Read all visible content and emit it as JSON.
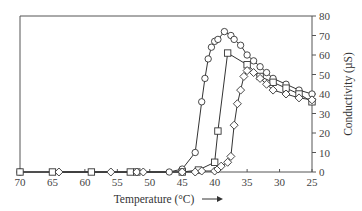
{
  "chart_data": {
    "type": "line",
    "title": "",
    "xlabel": "Temperature (°C) →",
    "ylabel": "Conductivity (µS)",
    "xlim": [
      70,
      25
    ],
    "ylim": [
      0,
      80
    ],
    "x_reversed": true,
    "x_ticks": [
      70,
      65,
      60,
      55,
      50,
      45,
      40,
      35,
      30,
      25
    ],
    "y_ticks": [
      0,
      10,
      20,
      30,
      40,
      50,
      60,
      70,
      80
    ],
    "y_axis_position": "right",
    "grid": false,
    "legend": null,
    "series": [
      {
        "name": "circles",
        "marker": "circle",
        "points": [
          [
            70,
            0
          ],
          [
            47,
            0
          ],
          [
            45,
            1.5
          ],
          [
            43,
            10
          ],
          [
            42,
            36
          ],
          [
            41.5,
            48
          ],
          [
            41,
            58
          ],
          [
            40.5,
            64
          ],
          [
            40,
            67
          ],
          [
            39.5,
            68
          ],
          [
            38.5,
            72
          ],
          [
            37.5,
            70
          ],
          [
            37,
            68
          ],
          [
            36,
            65
          ],
          [
            35,
            60
          ],
          [
            34,
            57
          ],
          [
            33,
            54
          ],
          [
            32,
            51
          ],
          [
            31,
            48
          ],
          [
            29,
            45
          ],
          [
            27,
            42
          ],
          [
            25,
            40
          ]
        ]
      },
      {
        "name": "squares",
        "marker": "square",
        "points": [
          [
            70,
            0
          ],
          [
            65,
            0
          ],
          [
            59,
            0
          ],
          [
            53,
            0
          ],
          [
            52,
            0
          ],
          [
            45,
            0
          ],
          [
            42.5,
            1
          ],
          [
            40,
            5
          ],
          [
            39.5,
            21
          ],
          [
            38,
            61
          ],
          [
            35,
            55
          ],
          [
            33,
            49
          ],
          [
            31,
            46
          ],
          [
            29,
            43
          ],
          [
            27,
            40
          ],
          [
            25,
            36
          ]
        ]
      },
      {
        "name": "diamonds",
        "marker": "diamond",
        "points": [
          [
            64,
            0
          ],
          [
            56,
            0
          ],
          [
            52,
            0
          ],
          [
            51,
            0
          ],
          [
            45,
            0
          ],
          [
            43,
            0
          ],
          [
            42,
            0.5
          ],
          [
            40,
            0.5
          ],
          [
            39.5,
            1.5
          ],
          [
            39,
            3
          ],
          [
            38,
            5
          ],
          [
            37.5,
            8
          ],
          [
            37,
            24
          ],
          [
            36.5,
            35
          ],
          [
            36,
            42
          ],
          [
            35.5,
            49
          ],
          [
            35,
            52
          ],
          [
            34,
            51
          ],
          [
            33,
            48
          ],
          [
            32,
            45
          ],
          [
            31,
            42
          ],
          [
            29,
            40
          ],
          [
            27,
            38
          ],
          [
            25,
            37
          ]
        ]
      }
    ]
  },
  "axes": {
    "x_title": "Temperature (°C)",
    "x_arrow": "→",
    "y_title": "Conductivity (µS)"
  }
}
